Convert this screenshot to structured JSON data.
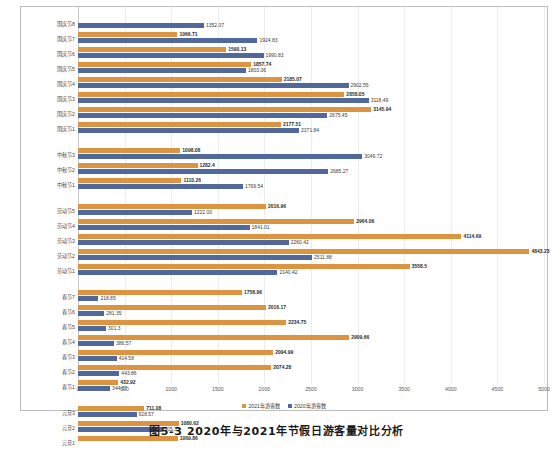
{
  "chart_data": {
    "type": "bar",
    "orientation": "horizontal",
    "title": "",
    "xlabel": "",
    "ylabel": "",
    "xlim": [
      0,
      5000
    ],
    "xticks": [
      0,
      500,
      1000,
      1500,
      2000,
      2500,
      3000,
      3500,
      4000,
      4500,
      5000
    ],
    "xtick_labels": [
      "0",
      "500",
      "1000",
      "1500",
      "2000",
      "2500",
      "3000",
      "3500",
      "4000",
      "4500",
      "5000"
    ],
    "grid": true,
    "legend_position": "bottom-center",
    "series": [
      {
        "name": "2021年游客数",
        "color": "#dd9440",
        "values": [
          null,
          1066.71,
          1590.13,
          1857.74,
          2185.07,
          2858.05,
          3145.94,
          2177.51,
          1098.08,
          1282.4,
          1110.26,
          2016.96,
          2964.06,
          4114.69,
          4843.23,
          3558.5,
          1758.96,
          2016.17,
          2234.75,
          2909.66,
          2094.99,
          2074.28,
          432.92,
          711.08,
          1080.62,
          1069.86
        ]
      },
      {
        "name": "2020年游客数",
        "color": "#51689d",
        "values": [
          1352.07,
          1924.83,
          1990.83,
          1803.06,
          2902.55,
          3118.49,
          2675.45,
          2371.84,
          3049.72,
          2685.27,
          1769.54,
          1222.0,
          1841.01,
          2260.42,
          2511.88,
          2140.42,
          218.85,
          281.35,
          301.3,
          386.57,
          414.58,
          443.86,
          344.57,
          628.57,
          905.35,
          null
        ]
      }
    ],
    "groups": [
      {
        "name": "国庆节",
        "rows": [
          {
            "category": "国庆节8",
            "orange": null,
            "blue": 1352.07,
            "orange_label": "",
            "blue_label": "1352.07"
          },
          {
            "category": "国庆节7",
            "orange": 1066.71,
            "blue": 1924.83,
            "orange_label": "1066.71",
            "blue_label": "1924.83"
          },
          {
            "category": "国庆节6",
            "orange": 1590.13,
            "blue": 1990.83,
            "orange_label": "1590.13",
            "blue_label": "1990.83"
          },
          {
            "category": "国庆节5",
            "orange": 1857.74,
            "blue": 1803.06,
            "orange_label": "1857.74",
            "blue_label": "1803.06"
          },
          {
            "category": "国庆节4",
            "orange": 2185.07,
            "blue": 2902.55,
            "orange_label": "2185.07",
            "blue_label": "2902.55"
          },
          {
            "category": "国庆节3",
            "orange": 2858.05,
            "blue": 3118.49,
            "orange_label": "2858.05",
            "blue_label": "3118.49"
          },
          {
            "category": "国庆节2",
            "orange": 3145.94,
            "blue": 2675.45,
            "orange_label": "3145.94",
            "blue_label": "2675.45"
          },
          {
            "category": "国庆节1",
            "orange": 2177.51,
            "blue": 2371.84,
            "orange_label": "2177.51",
            "blue_label": "2371.84"
          }
        ]
      },
      {
        "name": "中秋节",
        "rows": [
          {
            "category": "中秋节3",
            "orange": 1098.08,
            "blue": 3049.72,
            "orange_label": "1098.08",
            "blue_label": "3049.72"
          },
          {
            "category": "中秋节2",
            "orange": 1282.4,
            "blue": 2685.27,
            "orange_label": "1282.4",
            "blue_label": "2685.27"
          },
          {
            "category": "中秋节1",
            "orange": 1110.26,
            "blue": 1769.54,
            "orange_label": "1110.26",
            "blue_label": "1769.54"
          }
        ]
      },
      {
        "name": "劳动节",
        "rows": [
          {
            "category": "劳动节5",
            "orange": 2016.96,
            "blue": 1222.0,
            "orange_label": "2016.96",
            "blue_label": "1222.00"
          },
          {
            "category": "劳动节4",
            "orange": 2964.06,
            "blue": 1841.01,
            "orange_label": "2964.06",
            "blue_label": "1841.01"
          },
          {
            "category": "劳动节3",
            "orange": 4114.69,
            "blue": 2260.42,
            "orange_label": "4114.69",
            "blue_label": "2260.42"
          },
          {
            "category": "劳动节2",
            "orange": 4843.23,
            "blue": 2511.88,
            "orange_label": "4843.23",
            "blue_label": "2511.88"
          },
          {
            "category": "劳动节1",
            "orange": 3558.5,
            "blue": 2140.42,
            "orange_label": "3558.5",
            "blue_label": "2140.42"
          }
        ]
      },
      {
        "name": "春节",
        "rows": [
          {
            "category": "春节7",
            "orange": 1758.96,
            "blue": 218.85,
            "orange_label": "1758.96",
            "blue_label": "218.85"
          },
          {
            "category": "春节6",
            "orange": 2016.17,
            "blue": 281.35,
            "orange_label": "2016.17",
            "blue_label": "281.35"
          },
          {
            "category": "春节5",
            "orange": 2234.75,
            "blue": 301.3,
            "orange_label": "2234.75",
            "blue_label": "301.3"
          },
          {
            "category": "春节4",
            "orange": 2909.66,
            "blue": 386.57,
            "orange_label": "2909.66",
            "blue_label": "386.57"
          },
          {
            "category": "春节3",
            "orange": 2094.99,
            "blue": 414.58,
            "orange_label": "2094.99",
            "blue_label": "414.58"
          },
          {
            "category": "春节2",
            "orange": 2074.28,
            "blue": 443.86,
            "orange_label": "2074.28",
            "blue_label": "443.86"
          },
          {
            "category": "春节1",
            "orange": 432.92,
            "blue": 344.57,
            "orange_label": "432.92",
            "blue_label": "344.57"
          }
        ]
      },
      {
        "name": "元旦",
        "rows": [
          {
            "category": "元旦3",
            "orange": 711.08,
            "blue": 628.57,
            "orange_label": "711.08",
            "blue_label": "628.57"
          },
          {
            "category": "元旦2",
            "orange": 1080.62,
            "blue": 905.35,
            "orange_label": "1080.62",
            "blue_label": "905.35"
          },
          {
            "category": "元旦1",
            "orange": 1069.86,
            "blue": null,
            "orange_label": "1069.86",
            "blue_label": ""
          }
        ]
      }
    ],
    "legend": [
      {
        "label": "2021年游客数",
        "color": "#dd9440"
      },
      {
        "label": "2020年游客数",
        "color": "#51689d"
      }
    ]
  },
  "caption": "图5-3 2020年与2021年节假日游客量对比分析"
}
